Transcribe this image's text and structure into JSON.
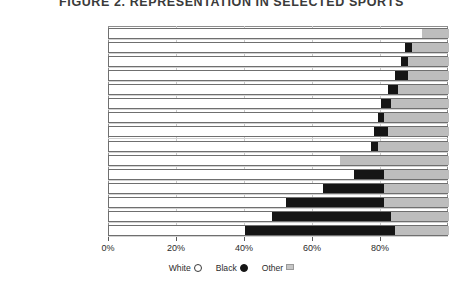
{
  "chart_data": {
    "type": "bar",
    "orientation": "horizontal",
    "stacked": true,
    "title": "FIGURE 2. REPRESENTATION IN SELECTED SPORTS",
    "xlabel": "",
    "ylabel": "",
    "xlim": [
      0,
      100
    ],
    "grid": true,
    "legend_position": "bottom",
    "xticks": [
      0,
      20,
      40,
      60,
      80
    ],
    "xticklabels": [
      "0%",
      "20%",
      "40%",
      "60%",
      "80%"
    ],
    "legend": [
      {
        "name": "White",
        "marker": "open-circle",
        "color": "#ffffff"
      },
      {
        "name": "Black",
        "marker": "filled-circle",
        "color": "#151515"
      },
      {
        "name": "Other",
        "marker": "filled-square",
        "color": "#bdbdbd"
      }
    ],
    "categories": [
      "Men's Skiing DIII",
      "Men's Golf DIII",
      "Women's Equestrian",
      "Men's Lacrosse",
      "Field Hockey",
      "Baseball",
      "Men's Golf",
      "Women's Softball",
      "Men's Hockey",
      "Men's Water Polo DIII",
      "All Student-Athletes",
      "Men's Football DIII",
      "Men's Basketball DIII",
      "Men's Football",
      "Men's Basketball"
    ],
    "series": [
      {
        "name": "White",
        "values": [
          92,
          87,
          86,
          84,
          82,
          80,
          79,
          78,
          77,
          68,
          72,
          63,
          52,
          48,
          40
        ]
      },
      {
        "name": "Black",
        "values": [
          0,
          2,
          2,
          4,
          3,
          3,
          2,
          4,
          2,
          0,
          9,
          18,
          29,
          35,
          44
        ]
      },
      {
        "name": "Other",
        "values": [
          8,
          11,
          12,
          12,
          15,
          17,
          19,
          18,
          21,
          32,
          19,
          19,
          19,
          17,
          16
        ]
      }
    ]
  }
}
